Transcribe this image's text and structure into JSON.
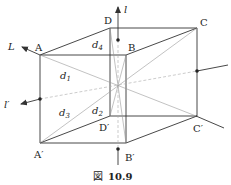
{
  "figure": {
    "caption_prefix": "図",
    "caption_number": "10.9",
    "colors": {
      "edge": "#333333",
      "diagonal": "#999999",
      "dashed": "#aaaaaa",
      "background": "#ffffff"
    }
  },
  "vertices": {
    "A": "A",
    "B": "B",
    "C": "C",
    "D": "D",
    "A_prime": "A′",
    "B_prime": "B′",
    "C_prime": "C′",
    "D_prime": "D′"
  },
  "axes": {
    "l": "l",
    "L": "L",
    "l_prime": "l′"
  },
  "diagonals": {
    "d1": "d",
    "d1_sub": "1",
    "d2": "d",
    "d2_sub": "2",
    "d3": "d",
    "d3_sub": "3",
    "d4": "d",
    "d4_sub": "4"
  }
}
